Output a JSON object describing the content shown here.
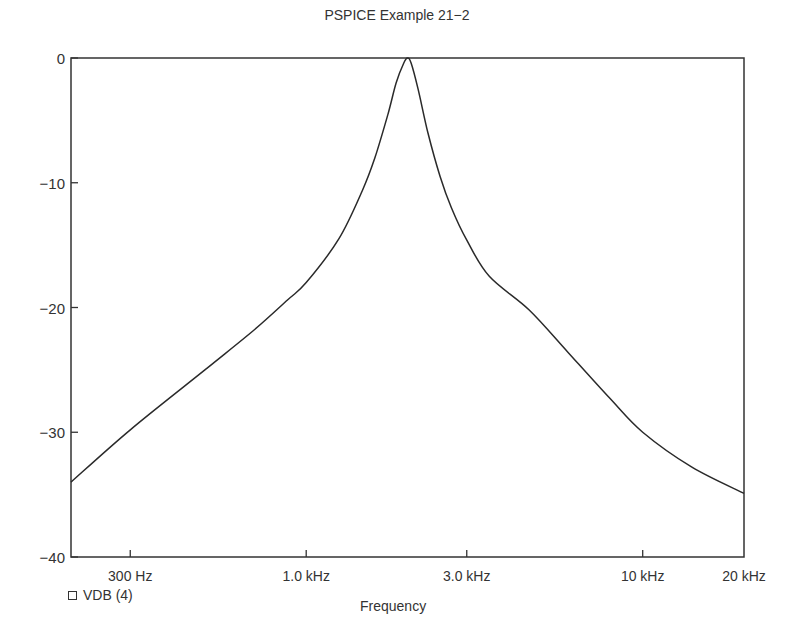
{
  "chart_data": {
    "type": "line",
    "title": "PSPICE Example 21−2",
    "xlabel": "Frequency",
    "ylabel": "",
    "xscale": "log",
    "xlim_hz": [
      200,
      20000
    ],
    "ylim": [
      -40,
      0
    ],
    "grid": false,
    "legend_position": "bottom-left",
    "yticks": [
      {
        "value": 0,
        "label": "0"
      },
      {
        "value": -10,
        "label": "−10"
      },
      {
        "value": -20,
        "label": "−20"
      },
      {
        "value": -30,
        "label": "−30"
      },
      {
        "value": -40,
        "label": "−40"
      }
    ],
    "xticks": [
      {
        "value": 300,
        "label": "300 Hz"
      },
      {
        "value": 1000,
        "label": "1.0 kHz"
      },
      {
        "value": 3000,
        "label": "3.0 kHz"
      },
      {
        "value": 10000,
        "label": "10 kHz"
      },
      {
        "value": 20000,
        "label": "20 kHz"
      }
    ],
    "series": [
      {
        "name": "VDB (4)",
        "marker": "square",
        "x_hz": [
          200,
          300,
          500,
          700,
          880,
          1000,
          1250,
          1470,
          1600,
          1750,
          1850,
          1950,
          2000,
          2050,
          2150,
          2300,
          2500,
          2700,
          3000,
          3500,
          4600,
          6000,
          8000,
          10000,
          14000,
          20000
        ],
        "values_db": [
          -34.0,
          -29.8,
          -25.0,
          -21.8,
          -19.4,
          -18.0,
          -14.5,
          -10.6,
          -8.0,
          -4.5,
          -2.0,
          -0.4,
          0.0,
          -0.4,
          -2.5,
          -6.0,
          -9.5,
          -12.0,
          -14.6,
          -17.5,
          -20.2,
          -23.6,
          -27.3,
          -30.0,
          -32.8,
          -34.9
        ]
      }
    ]
  },
  "legend": {
    "label": "VDB (4)"
  }
}
